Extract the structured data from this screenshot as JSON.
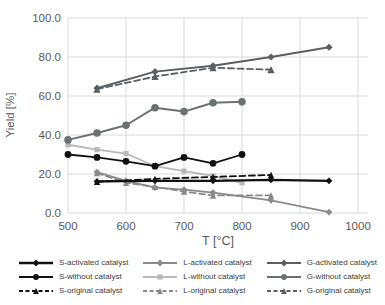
{
  "chart_data": {
    "type": "line",
    "title": "",
    "xlabel": "T [°C]",
    "ylabel": "Yield [%]",
    "xlim": [
      500,
      1000
    ],
    "ylim": [
      0,
      100
    ],
    "grid": true,
    "legend_position": "bottom",
    "x_tick_values": [
      500,
      600,
      700,
      800,
      900,
      1000
    ],
    "x_tick_labels": [
      "500",
      "600",
      "700",
      "800",
      "900",
      "1000"
    ],
    "y_tick_values": [
      0,
      20,
      40,
      60,
      80,
      100
    ],
    "y_tick_labels": [
      "0.0",
      "20.0",
      "40.0",
      "60.0",
      "80.0",
      "100.0"
    ],
    "series": [
      {
        "name": "S-activated catalyst",
        "color": "#111111",
        "dash": "solid",
        "marker": "diamond",
        "marker_size": 2.8,
        "width": 2.4,
        "points": [
          [
            550,
            16.2
          ],
          [
            650,
            16.5
          ],
          [
            750,
            16.5
          ],
          [
            850,
            17
          ],
          [
            950,
            16.5
          ]
        ]
      },
      {
        "name": "S-without catalyst",
        "color": "#111111",
        "dash": "solid",
        "marker": "circle",
        "marker_size": 3.4,
        "width": 1.8,
        "points": [
          [
            500,
            30
          ],
          [
            550,
            28.5
          ],
          [
            600,
            26.5
          ],
          [
            650,
            24
          ],
          [
            700,
            28.5
          ],
          [
            750,
            25.5
          ],
          [
            800,
            30
          ]
        ]
      },
      {
        "name": "S-original catalyst",
        "color": "#111111",
        "dash": "dashed",
        "marker": "triangle",
        "marker_size": 3.2,
        "width": 1.8,
        "points": [
          [
            550,
            16
          ],
          [
            650,
            17.5
          ],
          [
            750,
            18.5
          ],
          [
            850,
            19.5
          ]
        ]
      },
      {
        "name": "L-activated catalyst",
        "color": "#8a8a8a",
        "dash": "solid",
        "marker": "diamond",
        "marker_size": 2.8,
        "width": 1.8,
        "points": [
          [
            550,
            21
          ],
          [
            600,
            16.5
          ],
          [
            650,
            13
          ],
          [
            700,
            12
          ],
          [
            750,
            10.5
          ],
          [
            850,
            6.5
          ],
          [
            950,
            0.5
          ]
        ]
      },
      {
        "name": "L-without catalyst",
        "color": "#b8b8b8",
        "dash": "solid",
        "marker": "square",
        "marker_size": 2.6,
        "width": 1.8,
        "points": [
          [
            500,
            35
          ],
          [
            550,
            32.5
          ],
          [
            600,
            30.5
          ],
          [
            650,
            24
          ],
          [
            700,
            21.5
          ],
          [
            750,
            19
          ],
          [
            800,
            15.5
          ]
        ]
      },
      {
        "name": "L-original catalyst",
        "color": "#8a8a8a",
        "dash": "dashed",
        "marker": "triangle",
        "marker_size": 3.2,
        "width": 1.8,
        "points": [
          [
            550,
            20.5
          ],
          [
            600,
            15.5
          ],
          [
            650,
            13.5
          ],
          [
            700,
            11
          ],
          [
            750,
            9
          ],
          [
            850,
            9
          ]
        ]
      },
      {
        "name": "G-activated catalyst",
        "color": "#5a5f63",
        "dash": "solid",
        "marker": "diamond",
        "marker_size": 3.0,
        "width": 2.0,
        "points": [
          [
            550,
            64
          ],
          [
            650,
            72.5
          ],
          [
            750,
            75.5
          ],
          [
            850,
            80
          ],
          [
            950,
            85
          ]
        ]
      },
      {
        "name": "G-without catalyst",
        "color": "#6b7073",
        "dash": "solid",
        "marker": "circle",
        "marker_size": 3.8,
        "width": 2.0,
        "points": [
          [
            500,
            37.5
          ],
          [
            550,
            41
          ],
          [
            600,
            45
          ],
          [
            650,
            54
          ],
          [
            700,
            52
          ],
          [
            750,
            56.5
          ],
          [
            800,
            57
          ]
        ]
      },
      {
        "name": "G-original catalyst",
        "color": "#5a5f63",
        "dash": "dashed",
        "marker": "triangle",
        "marker_size": 3.6,
        "width": 1.8,
        "points": [
          [
            550,
            63.5
          ],
          [
            650,
            70
          ],
          [
            750,
            74.5
          ],
          [
            850,
            73.5
          ]
        ]
      }
    ]
  },
  "colors": {
    "grid": "#d9d9d9",
    "axis_text": "#595959",
    "legend_text": "#3d3d3d",
    "background": "#ffffff"
  }
}
